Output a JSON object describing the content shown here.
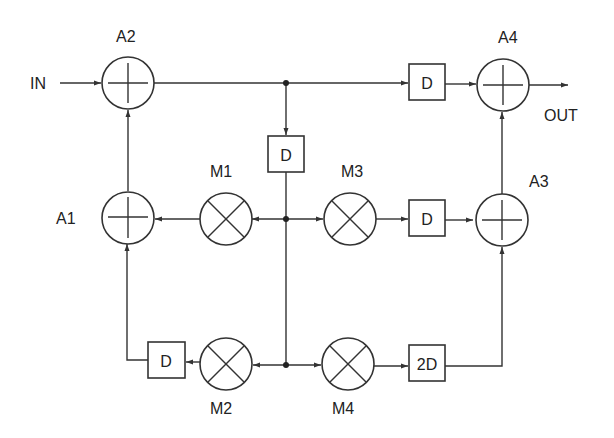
{
  "diagram": {
    "type": "signal-flow block diagram",
    "input_label": "IN",
    "output_label": "OUT",
    "adders": [
      {
        "id": "A1",
        "label": "A1"
      },
      {
        "id": "A2",
        "label": "A2"
      },
      {
        "id": "A3",
        "label": "A3"
      },
      {
        "id": "A4",
        "label": "A4"
      }
    ],
    "multipliers": [
      {
        "id": "M1",
        "label": "M1"
      },
      {
        "id": "M2",
        "label": "M2"
      },
      {
        "id": "M3",
        "label": "M3"
      },
      {
        "id": "M4",
        "label": "M4"
      }
    ],
    "delays": [
      {
        "id": "D_top",
        "label": "D"
      },
      {
        "id": "D_center",
        "label": "D"
      },
      {
        "id": "D_mid",
        "label": "D"
      },
      {
        "id": "D_bottom",
        "label": "D"
      },
      {
        "id": "D_2",
        "label": "2D"
      }
    ],
    "connections": [
      "IN -> A2",
      "A2 -> junction_top",
      "junction_top -> D_top -> A4",
      "junction_top -> D_center -> junction_mid",
      "junction_mid -> M1 -> A1",
      "junction_mid -> M3 -> D_mid -> A3",
      "junction_mid -> junction_bottom",
      "junction_bottom -> M2 -> D_bottom -> A1",
      "junction_bottom -> M4 -> D_2 -> A3",
      "A1 -> A2",
      "A3 -> A4",
      "A4 -> OUT"
    ]
  },
  "colors": {
    "line": "#333333",
    "background": "#ffffff"
  }
}
